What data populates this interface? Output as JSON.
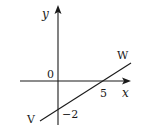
{
  "diagram": {
    "type": "coordinate-graph",
    "axes": {
      "x_label": "x",
      "y_label": "y",
      "origin_label": "0"
    },
    "line": {
      "name": "VW",
      "start_label": "V",
      "end_label": "W",
      "x_intercept": 5,
      "y_intercept": -2,
      "x_intercept_label": "5",
      "y_intercept_label": "−2"
    },
    "colors": {
      "stroke": "#1a1a1a",
      "background": "#ffffff"
    }
  }
}
